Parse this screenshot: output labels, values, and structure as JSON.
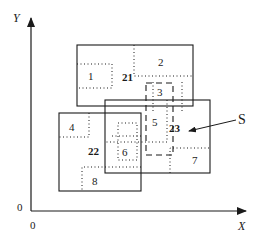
{
  "diagram": {
    "axes": {
      "x_label": "X",
      "y_label": "Y",
      "origin_x_label": "0",
      "origin_y_label": "0"
    },
    "query": {
      "label": "S",
      "style": "dashed"
    },
    "nodes": [
      {
        "id": "21",
        "kind": "solid",
        "label": "21"
      },
      {
        "id": "22",
        "kind": "solid",
        "label": "22"
      },
      {
        "id": "23",
        "kind": "solid",
        "label": "23"
      }
    ],
    "leaves": [
      {
        "id": "1",
        "label": "1",
        "parent": "21"
      },
      {
        "id": "2",
        "label": "2",
        "parent": "21"
      },
      {
        "id": "3",
        "label": "3",
        "parent": "21"
      },
      {
        "id": "4",
        "label": "4",
        "parent": "22"
      },
      {
        "id": "6",
        "label": "6",
        "parent": "22"
      },
      {
        "id": "8",
        "label": "8",
        "parent": "22"
      },
      {
        "id": "5",
        "label": "5",
        "parent": "23"
      },
      {
        "id": "7",
        "label": "7",
        "parent": "23"
      }
    ],
    "colors": {
      "ink": "#1a1a1a",
      "background": "#ffffff"
    }
  }
}
